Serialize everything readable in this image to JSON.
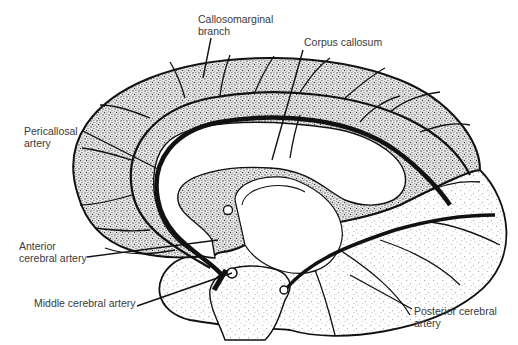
{
  "diagram": {
    "colors": {
      "ink": "#111111",
      "label_text": "#3a3a3a",
      "dense_stipple": "#8a8a8a",
      "sparse_stipple": "#b0b0b0",
      "background": "#ffffff"
    },
    "labels": [
      {
        "id": "callosomarginal",
        "text": "Callosomarginal\nbranch",
        "x": 198,
        "y": 13
      },
      {
        "id": "corpus-callosum",
        "text": "Corpus callosum",
        "x": 304,
        "y": 36
      },
      {
        "id": "pericallosal",
        "text": "Pericallosal\nartery",
        "x": 24,
        "y": 125
      },
      {
        "id": "anterior-cerebral",
        "text": "Anterior\ncerebral artery",
        "x": 19,
        "y": 240
      },
      {
        "id": "middle-cerebral",
        "text": "Middle cerebral artery",
        "x": 34,
        "y": 297
      },
      {
        "id": "posterior-cerebral",
        "text": "Posterior cerebral\nartery",
        "x": 414,
        "y": 305
      }
    ],
    "regions": [
      {
        "name": "anterior-cerebral-territory",
        "fill": "dense stipple"
      },
      {
        "name": "posterior-cerebral-territory",
        "fill": "sparse stipple"
      },
      {
        "name": "corpus-callosum",
        "fill": "white"
      }
    ]
  }
}
